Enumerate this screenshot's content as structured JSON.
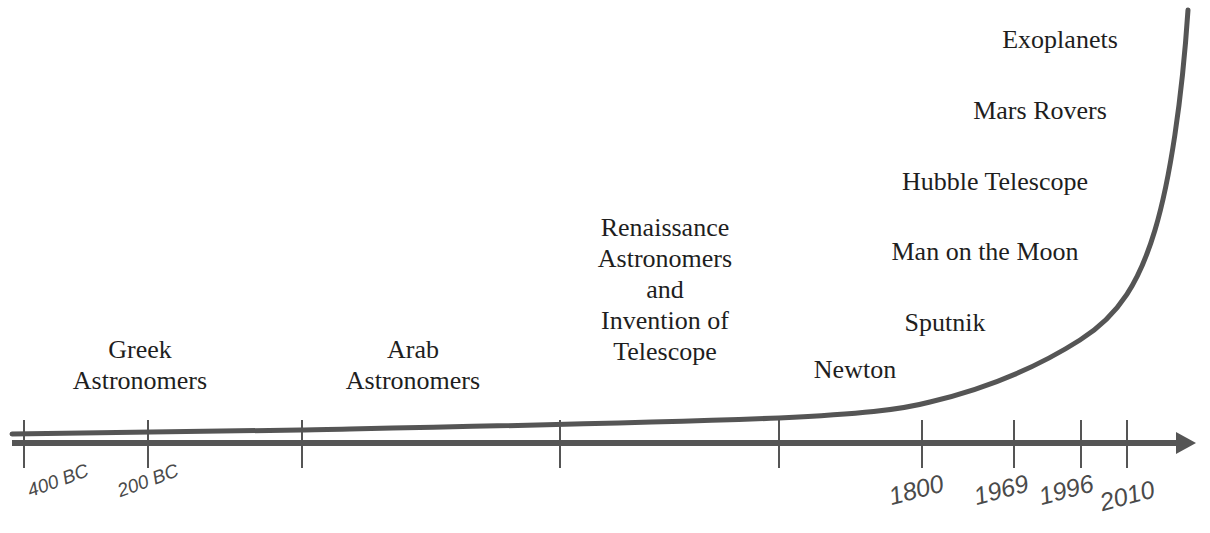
{
  "diagram": {
    "title": "",
    "type": "timeline-exponential-growth",
    "colors": {
      "background": "#ffffff",
      "line": "#555555",
      "text": "#1e1e1e",
      "tick_label": "#4a4a4a"
    },
    "axis": {
      "direction": "left-to-right arrow",
      "ticks": [
        {
          "x": 24,
          "label": "400 BC"
        },
        {
          "x": 148,
          "label": "200 BC"
        },
        {
          "x": 302,
          "label": ""
        },
        {
          "x": 560,
          "label": ""
        },
        {
          "x": 779,
          "label": ""
        },
        {
          "x": 922,
          "label": "1800"
        },
        {
          "x": 1014,
          "label": "1969"
        },
        {
          "x": 1081,
          "label": "1996"
        },
        {
          "x": 1127,
          "label": "2010"
        }
      ]
    },
    "events": [
      {
        "id": "greek",
        "lines": [
          "Greek",
          "Astronomers"
        ]
      },
      {
        "id": "arab",
        "lines": [
          "Arab",
          "Astronomers"
        ]
      },
      {
        "id": "renaissance",
        "lines": [
          "Renaissance",
          "Astronomers",
          "and",
          "Invention of",
          "Telescope"
        ]
      },
      {
        "id": "newton",
        "lines": [
          "Newton"
        ]
      },
      {
        "id": "sputnik",
        "lines": [
          "Sputnik"
        ]
      },
      {
        "id": "moon",
        "lines": [
          "Man on the Moon"
        ]
      },
      {
        "id": "hubble",
        "lines": [
          "Hubble Telescope"
        ]
      },
      {
        "id": "mars",
        "lines": [
          "Mars Rovers"
        ]
      },
      {
        "id": "exoplanets",
        "lines": [
          "Exoplanets"
        ]
      }
    ]
  }
}
